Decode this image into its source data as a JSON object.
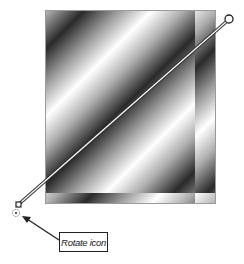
{
  "figure": {
    "gradient": {
      "stops": [
        "#ffffff",
        "#b0b0b0",
        "#2a2a2a",
        "#9a9a9a",
        "#ffffff"
      ],
      "angle_deg": 135
    },
    "gradient_tool": {
      "start_handle": "square-handle",
      "end_handle": "circle-handle",
      "line_color": "#333333"
    },
    "callout": {
      "label": "Rotate icon"
    }
  }
}
